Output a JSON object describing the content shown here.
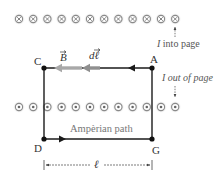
{
  "diagram": {
    "top_row": {
      "symbol": "current-into-page-icon",
      "count": 12,
      "y": 19,
      "x_start": 19,
      "x_step": 14.2
    },
    "bottom_row": {
      "symbol": "current-out-of-page-icon",
      "count": 12,
      "y": 107,
      "x_start": 19,
      "x_step": 14.2
    },
    "corners": {
      "C": {
        "label": "C",
        "x": 44,
        "y": 68
      },
      "A": {
        "label": "A",
        "x": 152,
        "y": 68
      },
      "D": {
        "label": "D",
        "x": 44,
        "y": 139
      },
      "G": {
        "label": "G",
        "x": 152,
        "y": 139
      }
    },
    "vectors": {
      "B_label": "B",
      "dl_label": "dℓ"
    },
    "annotations": {
      "into_page_I": "I",
      "into_page_text": " into page",
      "out_of_page_I": "I",
      "out_of_page_text": " out of page",
      "path_label": "Ampèrian path",
      "length_label": "ℓ"
    },
    "colors": {
      "path": "#1a1a1a",
      "vector_gray": "#9a9a9a",
      "symbol_ring": "#8a8a8a",
      "symbol_glow": "#d8d8d8",
      "text": "#333333"
    }
  }
}
